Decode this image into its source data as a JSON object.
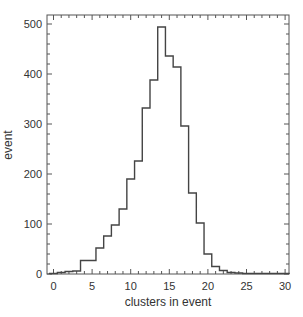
{
  "chart_data": {
    "type": "bar",
    "style": "step-histogram",
    "title": "",
    "xlabel": "clusters in event",
    "ylabel": "event",
    "xlim": [
      -0.5,
      30.5
    ],
    "ylim": [
      0,
      510
    ],
    "xticks": [
      0,
      5,
      10,
      15,
      20,
      25,
      30
    ],
    "yticks": [
      0,
      100,
      200,
      300,
      400,
      500
    ],
    "grid": false,
    "bin_width": 1,
    "categories": [
      0,
      1,
      2,
      3,
      4,
      5,
      6,
      7,
      8,
      9,
      10,
      11,
      12,
      13,
      14,
      15,
      16,
      17,
      18,
      19,
      20,
      21,
      22,
      23,
      24,
      25,
      26,
      27,
      28,
      29,
      30
    ],
    "values": [
      1,
      3,
      5,
      6,
      27,
      27,
      52,
      76,
      98,
      130,
      190,
      226,
      332,
      388,
      494,
      436,
      414,
      296,
      162,
      102,
      40,
      15,
      7,
      3,
      2,
      1,
      1,
      1,
      1,
      1,
      1
    ]
  }
}
